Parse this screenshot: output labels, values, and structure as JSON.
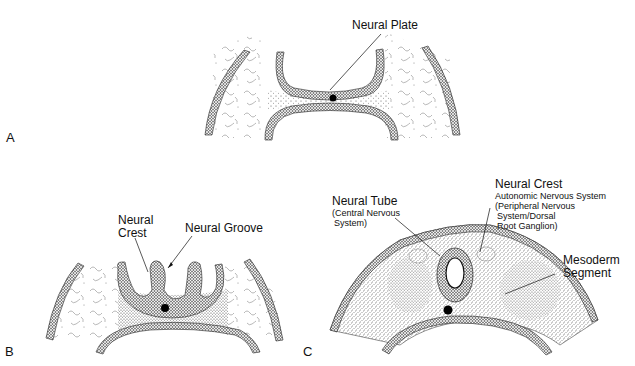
{
  "panels": {
    "A": {
      "letter": "A",
      "labels": {
        "neural_plate": "Neural Plate"
      }
    },
    "B": {
      "letter": "B",
      "labels": {
        "neural_crest_line1": "Neural",
        "neural_crest_line2": "Crest",
        "neural_groove": "Neural Groove"
      }
    },
    "C": {
      "letter": "C",
      "labels": {
        "neural_tube": "Neural Tube",
        "neural_tube_sub1": "(Central Nervous",
        "neural_tube_sub2": "System)",
        "neural_crest": "Neural Crest",
        "neural_crest_sub1": "Autonomic Nervous System",
        "neural_crest_sub2": "(Peripheral Nervous",
        "neural_crest_sub3": "System/Dorsal",
        "neural_crest_sub4": "Root Ganglion)",
        "mesoderm_line1": "Mesoderm",
        "mesoderm_line2": "Segment"
      }
    }
  },
  "colors": {
    "ink": "#111111",
    "epithelium": "#3a3a3a",
    "mesenchyme": "#9a9a9a",
    "background": "#ffffff"
  }
}
